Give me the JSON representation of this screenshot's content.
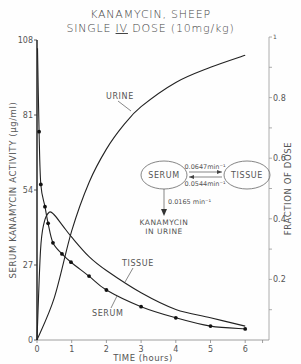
{
  "chart_data": {
    "type": "line",
    "title": "KANAMYCIN, SHEEP",
    "subtitle_prefix": "SINGLE ",
    "subtitle_underlined": "IV",
    "subtitle_suffix": " DOSE (10mg/kg)",
    "xlabel": "TIME (hours)",
    "ylabel": "SERUM KANAMYCIN ACTIVITY (µg/ml)",
    "y2label": "FRACTION OF DOSE",
    "xlim": [
      0,
      6.5
    ],
    "ylim": [
      0,
      108
    ],
    "y2lim": [
      0,
      1
    ],
    "x_ticks": [
      "0",
      "1",
      "2",
      "3",
      "4",
      "5",
      "6"
    ],
    "y_ticks": [
      "0",
      "27",
      "54",
      "81",
      "108"
    ],
    "y2_ticks": [
      "0.2",
      "0.4",
      "0.6",
      "0.8",
      "1"
    ],
    "grid": false,
    "series": [
      {
        "name": "SERUM",
        "axis": "left",
        "markers": true,
        "x": [
          0.06,
          0.11,
          0.23,
          0.32,
          0.46,
          0.72,
          0.98,
          1.5,
          2.0,
          3.0,
          4.0,
          5.0,
          6.0
        ],
        "values": [
          75,
          56,
          48,
          42,
          35,
          31,
          28,
          23,
          18,
          12,
          8,
          5,
          4
        ]
      },
      {
        "name": "TISSUE",
        "axis": "left",
        "markers": false,
        "x": [
          0,
          0.1,
          0.2,
          0.35,
          0.5,
          0.75,
          1.0,
          1.5,
          2.0,
          3.0,
          4.0,
          5.0,
          6.0
        ],
        "values": [
          0,
          32,
          42,
          46,
          45,
          41,
          37,
          30,
          25,
          17,
          11,
          8,
          5
        ]
      },
      {
        "name": "URINE",
        "axis": "right",
        "markers": false,
        "x": [
          0,
          0.5,
          1.0,
          1.5,
          2.0,
          2.5,
          3.0,
          4.0,
          5.0,
          6.0
        ],
        "values": [
          0,
          0.14,
          0.36,
          0.52,
          0.63,
          0.71,
          0.77,
          0.85,
          0.9,
          0.94
        ]
      }
    ],
    "annotations": {
      "compartment_serum": "SERUM",
      "compartment_tissue": "TISSUE",
      "rate_serum_to_tissue": "0.0647min⁻¹",
      "rate_tissue_to_serum": "0.0544min⁻¹",
      "rate_elimination": "0.0165 min⁻¹",
      "elimination_label_line1": "KANAMYCIN",
      "elimination_label_line2": "IN URINE"
    }
  }
}
